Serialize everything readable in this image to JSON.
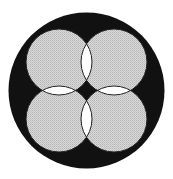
{
  "diagram": {
    "canvas": {
      "width": 173,
      "height": 179,
      "background": "#ffffff"
    },
    "outer_circle": {
      "cx": 86.5,
      "cy": 90.5,
      "r": 78,
      "fill": "#111111"
    },
    "inner_circles": [
      {
        "id": "top-left",
        "cx": 59,
        "cy": 62,
        "r": 33
      },
      {
        "id": "top-right",
        "cx": 114,
        "cy": 62,
        "r": 33
      },
      {
        "id": "bottom-left",
        "cx": 59,
        "cy": 119,
        "r": 33
      },
      {
        "id": "bottom-right",
        "cx": 114,
        "cy": 119,
        "r": 33
      }
    ],
    "inner_fill": "#cfcfcf",
    "overlap_fill": "#ffffff",
    "stroke": "#222222",
    "center_diamond_fill": "#111111"
  }
}
